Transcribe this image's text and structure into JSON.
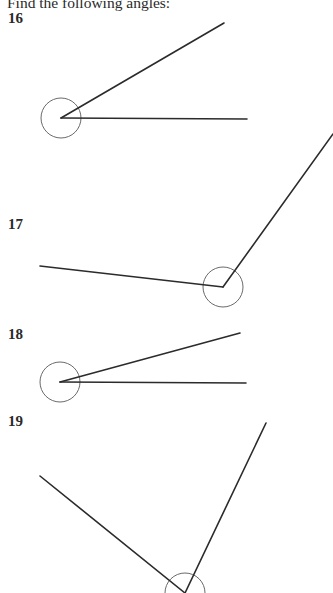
{
  "heading": "Find the following angles:",
  "questions": [
    {
      "number": "16",
      "label_top": 10,
      "vertex": [
        61,
        118
      ],
      "rays": [
        [
          224,
          23
        ],
        [
          247,
          119
        ]
      ],
      "arc_radius": 20
    },
    {
      "number": "17",
      "label_top": 216,
      "vertex": [
        223,
        287
      ],
      "rays": [
        [
          333,
          134
        ],
        [
          40,
          266
        ]
      ],
      "arc_radius": 20
    },
    {
      "number": "18",
      "label_top": 326,
      "vertex": [
        60,
        382
      ],
      "rays": [
        [
          240,
          333
        ],
        [
          246,
          383
        ]
      ],
      "arc_radius": 20
    },
    {
      "number": "19",
      "label_top": 413,
      "vertex": [
        185,
        593
      ],
      "rays": [
        [
          266,
          423
        ],
        [
          40,
          476
        ]
      ],
      "arc_radius": 20
    }
  ],
  "colors": {
    "line": "#2b2b2b",
    "arc": "#6a6a6a",
    "text": "#2a2a2a"
  }
}
